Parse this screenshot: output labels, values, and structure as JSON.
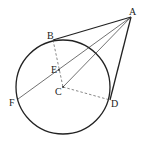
{
  "figure": {
    "type": "geometry-diagram",
    "points": {
      "A": {
        "label": "A",
        "x": 131,
        "y": 17
      },
      "B": {
        "label": "B",
        "x": 53,
        "y": 40
      },
      "C": {
        "label": "C",
        "x": 63,
        "y": 87
      },
      "D": {
        "label": "D",
        "x": 110,
        "y": 100
      },
      "E": {
        "label": "E",
        "x": 59,
        "y": 70
      },
      "F": {
        "label": "F",
        "x": 18,
        "y": 99
      }
    },
    "circle": {
      "center": "C",
      "radius": 47
    },
    "segments": [
      {
        "from": "A",
        "to": "B",
        "style": "solid",
        "weight": "thick"
      },
      {
        "from": "A",
        "to": "D",
        "style": "solid",
        "weight": "thick"
      },
      {
        "from": "A",
        "to": "F",
        "style": "solid",
        "weight": "thin"
      },
      {
        "from": "A",
        "to": "C",
        "style": "solid",
        "weight": "thin"
      },
      {
        "from": "B",
        "to": "C",
        "style": "dashed"
      },
      {
        "from": "C",
        "to": "D",
        "style": "dashed"
      }
    ],
    "colors": {
      "stroke": "#222222",
      "background": "#ffffff"
    }
  }
}
